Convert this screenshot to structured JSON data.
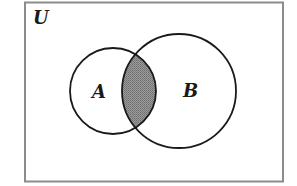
{
  "diagram": {
    "type": "venn",
    "universe": {
      "label": "U",
      "frame_color": "#8c8c8c"
    },
    "sets": [
      {
        "id": "A",
        "label": "A"
      },
      {
        "id": "B",
        "label": "B"
      }
    ],
    "shaded_region": "A ∩ B",
    "colors": {
      "outline": "#1a1a1a",
      "shade": "#8a8a8a",
      "background": "#ffffff"
    }
  }
}
